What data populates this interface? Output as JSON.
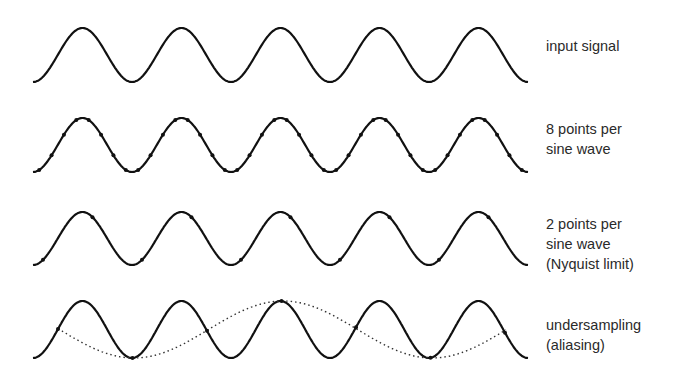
{
  "figure": {
    "type": "sampling-and-aliasing-diagram",
    "rows": [
      {
        "id": "input",
        "label_lines": [
          "input signal"
        ],
        "samples_per_cycle": 0,
        "show_alias": false
      },
      {
        "id": "eight-points",
        "label_lines": [
          "8 points per",
          "sine wave"
        ],
        "samples_per_cycle": 8,
        "show_alias": false
      },
      {
        "id": "nyquist",
        "label_lines": [
          "2 points per",
          "sine wave",
          "(Nyquist limit)"
        ],
        "samples_per_cycle": 2,
        "show_alias": false
      },
      {
        "id": "undersampling",
        "label_lines": [
          "undersampling",
          "(aliasing)"
        ],
        "samples_per_cycle": 0.75,
        "show_alias": true
      }
    ],
    "cycles_shown": 5,
    "colors": {
      "wave": "#111111",
      "alias": "#333333",
      "label": "#2a2a2a",
      "background": "#ffffff"
    }
  }
}
